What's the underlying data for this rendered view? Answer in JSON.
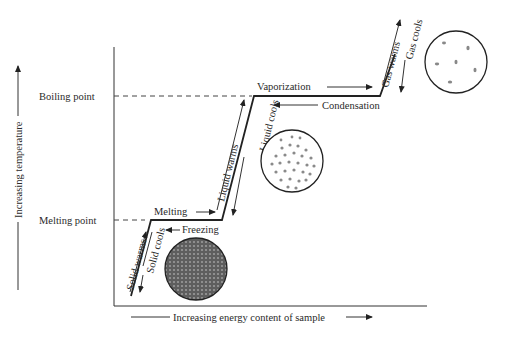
{
  "diagram": {
    "y_axis_label": "Increasing temperature",
    "x_axis_label": "Increasing energy content of sample",
    "y_ticks": {
      "boiling_point": "Boiling point",
      "melting_point": "Melting point"
    },
    "segments": {
      "solid_warms": "Solid warms",
      "solid_cools": "Solid cools",
      "melting": "Melting",
      "freezing": "Freezing",
      "liquid_warms": "Liquid warms",
      "liquid_cools": "Liquid cools",
      "vaporization": "Vaporization",
      "condensation": "Condensation",
      "gas_warms": "Gas warms",
      "gas_cools": "Gas cools"
    },
    "particle_illustrations": [
      "solid",
      "liquid",
      "gas"
    ],
    "colors": {
      "line": "#222222",
      "text": "#2a2a2a",
      "solid_fill": "#6a6a6a",
      "liquid_dot": "#8a8a8a",
      "gas_dot": "#8a8a8a"
    }
  }
}
